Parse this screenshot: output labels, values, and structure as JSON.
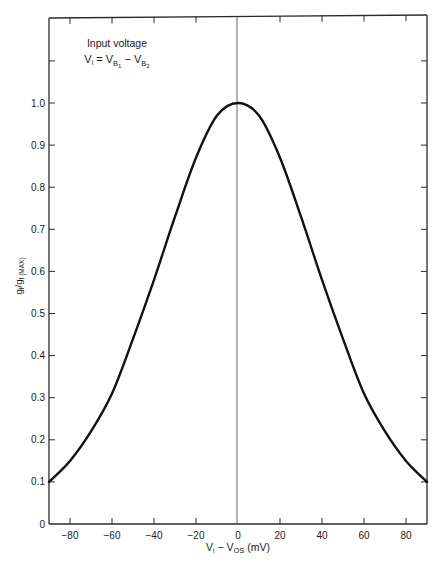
{
  "chart_data": {
    "type": "line",
    "title": "",
    "annotation": {
      "line1": "Input voltage",
      "line2_parts": {
        "lhs": "V",
        "lhs_sub": "i",
        "eq": " = V",
        "b1_sub": "B",
        "b1_subsub": "1",
        "minus": " − V",
        "b2_sub": "B",
        "b2_subsub": "2"
      }
    },
    "xlabel": "Vi − VOS (mV)",
    "xlabel_parts": {
      "v": "V",
      "v_sub": "i",
      "minus": " − V",
      "os_sub": "OS",
      "unit": " (mV)"
    },
    "ylabel": "gf/gf(MAX)",
    "ylabel_parts": {
      "g1": "g",
      "g1_sub": "f",
      "slash": "/g",
      "g2_sub": "f (MAX)"
    },
    "xlim": [
      -90,
      90
    ],
    "ylim": [
      0,
      1.2
    ],
    "x_ticks": [
      -80,
      -60,
      -40,
      -20,
      0,
      20,
      40,
      60,
      80
    ],
    "x_tick_labels": [
      "−80",
      "−60",
      "−40",
      "−20",
      "0",
      "20",
      "40",
      "60",
      "80"
    ],
    "y_ticks": [
      0,
      0.1,
      0.2,
      0.3,
      0.4,
      0.5,
      0.6,
      0.7,
      0.8,
      0.9,
      1.0,
      1.1
    ],
    "y_tick_labels": [
      "0",
      "0.1",
      "0.2",
      "0.3",
      "0.4",
      "0.5",
      "0.6",
      "0.7",
      "0.8",
      "0.9",
      "1.0",
      ""
    ],
    "grid": false,
    "legend": null,
    "series": [
      {
        "name": "gf/gf(MAX)",
        "x": [
          -90,
          -80,
          -70,
          -60,
          -50,
          -40,
          -30,
          -20,
          -10,
          0,
          10,
          20,
          30,
          40,
          50,
          60,
          70,
          80,
          90
        ],
        "values": [
          0.1,
          0.15,
          0.22,
          0.31,
          0.44,
          0.58,
          0.73,
          0.87,
          0.97,
          1.0,
          0.97,
          0.87,
          0.73,
          0.58,
          0.44,
          0.31,
          0.22,
          0.15,
          0.1
        ]
      }
    ],
    "reference_line": {
      "x": 0,
      "orientation": "vertical"
    }
  }
}
